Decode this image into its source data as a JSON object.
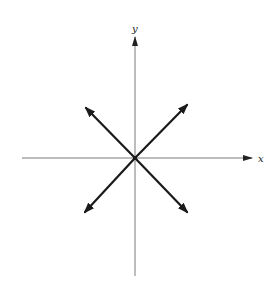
{
  "diagram": {
    "type": "coordinate-axes-with-vectors",
    "axes": {
      "x_label": "x",
      "y_label": "y"
    },
    "origin": [
      135,
      158
    ],
    "vectors": [
      {
        "name": "up-left",
        "direction": "northwest"
      },
      {
        "name": "up-right",
        "direction": "northeast"
      },
      {
        "name": "down-left",
        "direction": "southwest"
      },
      {
        "name": "down-right",
        "direction": "southeast"
      }
    ],
    "colors": {
      "axis": "#7a7a7a",
      "vector": "#1a1a1a",
      "background": "#ffffff"
    }
  }
}
